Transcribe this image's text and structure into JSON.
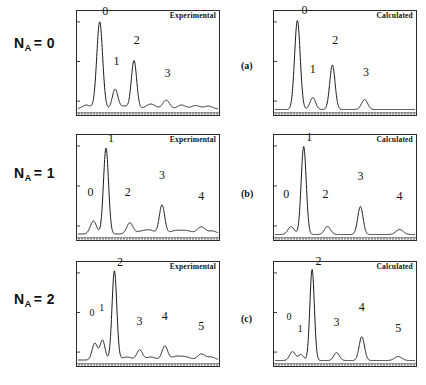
{
  "figure": {
    "width": 426,
    "height": 385,
    "background": "#ffffff",
    "ink": "#1a1a1a"
  },
  "rows": [
    {
      "id": "row-a",
      "letter": "(a)",
      "label_prefix": "N",
      "label_sub": "A",
      "label_value": "= 0",
      "label_full": "N_A = 0"
    },
    {
      "id": "row-b",
      "letter": "(b)",
      "label_prefix": "N",
      "label_sub": "A",
      "label_value": "= 1",
      "label_full": "N_A = 1"
    },
    {
      "id": "row-c",
      "letter": "(c)",
      "label_prefix": "N",
      "label_sub": "A",
      "label_value": "= 2",
      "label_full": "N_A = 2"
    }
  ],
  "column_titles": {
    "left": "Experimental",
    "right": "Calculated"
  },
  "chart_data": [
    {
      "id": "a-experimental",
      "type": "line",
      "title": "Experimental",
      "row": "N_A = 0",
      "panel": "(a)",
      "xlabel": "",
      "ylabel": "",
      "xlim": [
        0,
        100
      ],
      "ylim": [
        0,
        100
      ],
      "grid": false,
      "legend": "none",
      "peaks": [
        {
          "label": "0",
          "x": 15.5,
          "height": 88,
          "width": 2.1,
          "label_x": 19.5,
          "label_y": 95
        },
        {
          "label": "1",
          "x": 26.5,
          "height": 20,
          "width": 2.0,
          "label_x": 27.5,
          "label_y": 44
        },
        {
          "label": "2",
          "x": 40.0,
          "height": 49,
          "width": 1.9,
          "label_x": 42.0,
          "label_y": 66
        },
        {
          "label": "3",
          "x": 63.0,
          "height": 9,
          "width": 2.4,
          "label_x": 64.0,
          "label_y": 32
        }
      ],
      "minor_bumps": [
        {
          "x": 6.0,
          "height": 4.0,
          "width": 3.0
        },
        {
          "x": 33.0,
          "height": 3.0,
          "width": 2.5
        },
        {
          "x": 52.0,
          "height": 5.0,
          "width": 3.5
        },
        {
          "x": 74.0,
          "height": 4.0,
          "width": 3.0
        },
        {
          "x": 84.0,
          "height": 3.5,
          "width": 3.0
        },
        {
          "x": 93.0,
          "height": 3.0,
          "width": 3.0
        }
      ],
      "baseline": 2.0
    },
    {
      "id": "a-calculated",
      "type": "line",
      "title": "Calculated",
      "row": "N_A = 0",
      "panel": "(a)",
      "xlabel": "",
      "ylabel": "",
      "xlim": [
        0,
        100
      ],
      "ylim": [
        0,
        100
      ],
      "grid": false,
      "legend": "none",
      "peaks": [
        {
          "label": "0",
          "x": 16.0,
          "height": 90,
          "width": 2.0,
          "label_x": 21.0,
          "label_y": 96
        },
        {
          "label": "1",
          "x": 27.0,
          "height": 12,
          "width": 2.0,
          "label_x": 27.0,
          "label_y": 36
        },
        {
          "label": "2",
          "x": 41.0,
          "height": 45,
          "width": 1.9,
          "label_x": 43.0,
          "label_y": 66
        },
        {
          "label": "3",
          "x": 64.0,
          "height": 10,
          "width": 2.2,
          "label_x": 65.0,
          "label_y": 33
        }
      ],
      "minor_bumps": [],
      "baseline": 1.5
    },
    {
      "id": "b-experimental",
      "type": "line",
      "title": "Experimental",
      "row": "N_A = 1",
      "panel": "(b)",
      "xlabel": "",
      "ylabel": "",
      "xlim": [
        0,
        100
      ],
      "ylim": [
        0,
        100
      ],
      "grid": false,
      "legend": "none",
      "peaks": [
        {
          "label": "0",
          "x": 11.0,
          "height": 13,
          "width": 2.2,
          "label_x": 9.0,
          "label_y": 38
        },
        {
          "label": "1",
          "x": 20.0,
          "height": 86,
          "width": 1.8,
          "label_x": 23.5,
          "label_y": 92
        },
        {
          "label": "2",
          "x": 37.0,
          "height": 11,
          "width": 2.2,
          "label_x": 35.5,
          "label_y": 38
        },
        {
          "label": "3",
          "x": 60.0,
          "height": 29,
          "width": 1.9,
          "label_x": 60.0,
          "label_y": 55
        },
        {
          "label": "4",
          "x": 88.0,
          "height": 7,
          "width": 2.8,
          "label_x": 88.0,
          "label_y": 34
        }
      ],
      "minor_bumps": [
        {
          "x": 46.0,
          "height": 3.0,
          "width": 4.0
        },
        {
          "x": 52.0,
          "height": 3.0,
          "width": 3.0
        },
        {
          "x": 70.0,
          "height": 3.5,
          "width": 4.0
        },
        {
          "x": 78.0,
          "height": 3.0,
          "width": 3.5
        },
        {
          "x": 96.0,
          "height": 3.0,
          "width": 3.0
        }
      ],
      "baseline": 2.0
    },
    {
      "id": "b-calculated",
      "type": "line",
      "title": "Calculated",
      "row": "N_A = 1",
      "panel": "(b)",
      "xlabel": "",
      "ylabel": "",
      "xlim": [
        0,
        100
      ],
      "ylim": [
        0,
        100
      ],
      "grid": false,
      "legend": "none",
      "peaks": [
        {
          "label": "0",
          "x": 11.5,
          "height": 8,
          "width": 2.2,
          "label_x": 8.0,
          "label_y": 36
        },
        {
          "label": "1",
          "x": 20.5,
          "height": 88,
          "width": 1.8,
          "label_x": 24.5,
          "label_y": 93
        },
        {
          "label": "2",
          "x": 37.5,
          "height": 8,
          "width": 2.2,
          "label_x": 36.0,
          "label_y": 36
        },
        {
          "label": "3",
          "x": 61.0,
          "height": 28,
          "width": 1.9,
          "label_x": 61.0,
          "label_y": 54
        },
        {
          "label": "4",
          "x": 89.0,
          "height": 5,
          "width": 2.6,
          "label_x": 89.0,
          "label_y": 34
        }
      ],
      "minor_bumps": [],
      "baseline": 1.5
    },
    {
      "id": "c-experimental",
      "type": "line",
      "title": "Experimental",
      "row": "N_A = 2",
      "panel": "(c)",
      "xlabel": "",
      "ylabel": "",
      "xlim": [
        0,
        100
      ],
      "ylim": [
        0,
        100
      ],
      "grid": false,
      "legend": "none",
      "peaks": [
        {
          "label": "0",
          "x": 12.0,
          "height": 17,
          "width": 1.9,
          "label_x": 10.0,
          "label_y": 44
        },
        {
          "label": "1",
          "x": 17.5,
          "height": 20,
          "width": 1.8,
          "label_x": 17.0,
          "label_y": 50
        },
        {
          "label": "2",
          "x": 26.0,
          "height": 90,
          "width": 1.7,
          "label_x": 30.0,
          "label_y": 95
        },
        {
          "label": "3",
          "x": 44.0,
          "height": 10,
          "width": 2.0,
          "label_x": 44.0,
          "label_y": 35
        },
        {
          "label": "4",
          "x": 62.0,
          "height": 14,
          "width": 2.0,
          "label_x": 62.0,
          "label_y": 40
        },
        {
          "label": "5",
          "x": 88.0,
          "height": 6,
          "width": 2.6,
          "label_x": 88.0,
          "label_y": 30
        }
      ],
      "minor_bumps": [
        {
          "x": 35.0,
          "height": 3.0,
          "width": 3.5
        },
        {
          "x": 52.0,
          "height": 3.0,
          "width": 3.5
        },
        {
          "x": 70.0,
          "height": 3.5,
          "width": 3.5
        },
        {
          "x": 77.0,
          "height": 3.0,
          "width": 3.5
        },
        {
          "x": 95.0,
          "height": 3.0,
          "width": 3.0
        }
      ],
      "baseline": 2.0
    },
    {
      "id": "c-calculated",
      "type": "line",
      "title": "Calculated",
      "row": "N_A = 2",
      "panel": "(c)",
      "xlabel": "",
      "ylabel": "",
      "xlim": [
        0,
        100
      ],
      "ylim": [
        0,
        100
      ],
      "grid": false,
      "legend": "none",
      "peaks": [
        {
          "label": "0",
          "x": 12.5,
          "height": 9,
          "width": 2.0,
          "label_x": 10.0,
          "label_y": 40
        },
        {
          "label": "1",
          "x": 18.5,
          "height": 6,
          "width": 1.9,
          "label_x": 18.0,
          "label_y": 28
        },
        {
          "label": "2",
          "x": 26.5,
          "height": 92,
          "width": 1.6,
          "label_x": 31.0,
          "label_y": 96
        },
        {
          "label": "3",
          "x": 44.0,
          "height": 8,
          "width": 2.0,
          "label_x": 44.0,
          "label_y": 34
        },
        {
          "label": "4",
          "x": 62.0,
          "height": 24,
          "width": 1.9,
          "label_x": 62.0,
          "label_y": 50
        },
        {
          "label": "5",
          "x": 88.0,
          "height": 4,
          "width": 2.6,
          "label_x": 88.0,
          "label_y": 28
        }
      ],
      "minor_bumps": [],
      "baseline": 1.5
    }
  ],
  "axes": {
    "y_tick_positions": [
      10,
      50,
      90
    ],
    "x_tick_count": 48,
    "tick_color": "#2b2b2b"
  }
}
